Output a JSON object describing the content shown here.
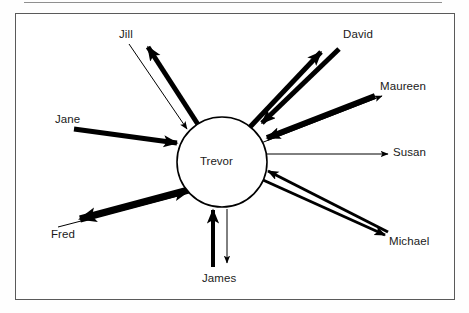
{
  "figure": {
    "type": "sociogram",
    "center": {
      "name": "Trevor"
    },
    "frame_border_color": "#5a5a5a",
    "stroke_color": "#000000",
    "background": "#ffffff"
  },
  "nodes": [
    {
      "id": "jill",
      "label": "Jill",
      "x": 128,
      "y": 35,
      "label_left": 119,
      "label_top": 28
    },
    {
      "id": "david",
      "label": "David",
      "x": 362,
      "y": 35,
      "label_left": 343,
      "label_top": 28
    },
    {
      "id": "maureen",
      "label": "Maureen",
      "x": 406,
      "y": 87,
      "label_left": 380,
      "label_top": 80
    },
    {
      "id": "susan",
      "label": "Susan",
      "x": 410,
      "y": 153,
      "label_left": 393,
      "label_top": 146
    },
    {
      "id": "michael",
      "label": "Michael",
      "x": 410,
      "y": 242,
      "label_left": 389,
      "label_top": 235
    },
    {
      "id": "james",
      "label": "James",
      "x": 222,
      "y": 279,
      "label_left": 202,
      "label_top": 272
    },
    {
      "id": "fred",
      "label": "Fred",
      "x": 65,
      "y": 235,
      "label_left": 51,
      "label_top": 228
    },
    {
      "id": "jane",
      "label": "Jane",
      "x": 69,
      "y": 120,
      "label_left": 55,
      "label_top": 113
    }
  ],
  "center_node": {
    "label": "Trevor",
    "cx": 222,
    "cy": 162,
    "r": 45,
    "label_left": 200,
    "label_top": 155
  },
  "edges": [
    {
      "id": "trevor-to-jill",
      "from": "Trevor",
      "to": "Jill",
      "direction": "outgoing",
      "weight": "thick",
      "width": 5
    },
    {
      "id": "jill-to-trevor",
      "from": "Jill",
      "to": "Trevor",
      "direction": "incoming",
      "weight": "thin",
      "width": 1
    },
    {
      "id": "trevor-to-david",
      "from": "Trevor",
      "to": "David",
      "direction": "outgoing",
      "weight": "thick",
      "width": 5
    },
    {
      "id": "david-to-trevor",
      "from": "David",
      "to": "Trevor",
      "direction": "incoming",
      "weight": "thick",
      "width": 5
    },
    {
      "id": "trevor-to-maureen",
      "from": "Trevor",
      "to": "Maureen",
      "direction": "outgoing",
      "weight": "thin",
      "width": 1
    },
    {
      "id": "maureen-to-trevor",
      "from": "Maureen",
      "to": "Trevor",
      "direction": "incoming",
      "weight": "thick",
      "width": 6
    },
    {
      "id": "trevor-to-susan",
      "from": "Trevor",
      "to": "Susan",
      "direction": "outgoing",
      "weight": "thin",
      "width": 1
    },
    {
      "id": "trevor-to-michael",
      "from": "Trevor",
      "to": "Michael",
      "direction": "outgoing",
      "weight": "medium",
      "width": 3
    },
    {
      "id": "michael-to-trevor",
      "from": "Michael",
      "to": "Trevor",
      "direction": "incoming",
      "weight": "medium",
      "width": 3
    },
    {
      "id": "james-to-trevor",
      "from": "James",
      "to": "Trevor",
      "direction": "incoming",
      "weight": "thick",
      "width": 4
    },
    {
      "id": "trevor-to-james",
      "from": "Trevor",
      "to": "James",
      "direction": "outgoing",
      "weight": "thin",
      "width": 1
    },
    {
      "id": "trevor-to-fred",
      "from": "Trevor",
      "to": "Fred",
      "direction": "outgoing",
      "weight": "thick",
      "width": 7
    },
    {
      "id": "fred-to-trevor",
      "from": "Fred",
      "to": "Trevor",
      "direction": "incoming",
      "weight": "thin",
      "width": 1
    },
    {
      "id": "jane-to-trevor",
      "from": "Jane",
      "to": "Trevor",
      "direction": "incoming",
      "weight": "thick",
      "width": 5
    }
  ]
}
